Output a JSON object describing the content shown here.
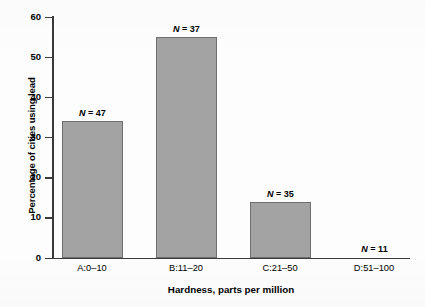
{
  "chart_data": {
    "type": "bar",
    "title": "",
    "xlabel": "Hardness, parts per million",
    "ylabel": "Percentage of cities using lead",
    "categories": [
      "A:0–10",
      "B:11–20",
      "C:21–50",
      "D:51–100"
    ],
    "values": [
      34,
      55,
      14,
      0
    ],
    "annotations": [
      "N = 47",
      "N = 37",
      "N = 35",
      "N = 11"
    ],
    "sample_sizes": [
      47,
      37,
      35,
      11
    ],
    "ylim": [
      0,
      60
    ],
    "yticks": [
      0,
      10,
      20,
      30,
      40,
      50,
      60
    ],
    "ytick_labels": [
      "0",
      "10",
      "20",
      "30",
      "40",
      "50",
      "60"
    ],
    "grid": false,
    "legend": false,
    "bar_color": "#a3a3a3",
    "bar_edge_color": "#6e6e6e",
    "axis_color": "#3a3a3a",
    "background_color": "#fdfdfd"
  }
}
